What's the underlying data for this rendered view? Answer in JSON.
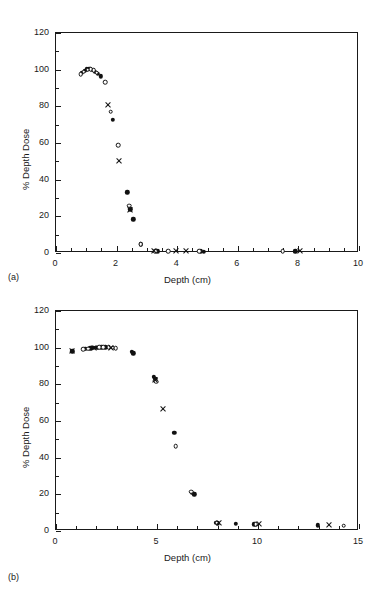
{
  "figure": {
    "panels": [
      {
        "id": "a",
        "sublabel": "(a)",
        "chart_data": {
          "type": "scatter",
          "title": "",
          "xlabel": "Depth (cm)",
          "ylabel": "% Depth Dose",
          "xlim": [
            0,
            10
          ],
          "ylim": [
            0,
            120
          ],
          "xticks": [
            0,
            2,
            4,
            6,
            8,
            10
          ],
          "yticks": [
            0,
            20,
            40,
            60,
            80,
            100,
            120
          ],
          "xminor_step": 0.5,
          "yminor_step": 10,
          "grid": false,
          "legend": "none",
          "series": [
            {
              "name": "filled-circle",
              "marker": "filled-circle",
              "points": [
                [
                  0.85,
                  98.3
                ],
                [
                  0.95,
                  99.4
                ],
                [
                  1.02,
                  100.2
                ],
                [
                  1.1,
                  100.4
                ],
                [
                  1.18,
                  100.0
                ],
                [
                  1.28,
                  99.0
                ],
                [
                  1.38,
                  97.8
                ],
                [
                  1.48,
                  96.3
                ],
                [
                  1.88,
                  72.8
                ],
                [
                  2.35,
                  33.2
                ],
                [
                  2.45,
                  23.8
                ],
                [
                  2.55,
                  18.4
                ],
                [
                  2.8,
                  4.7
                ],
                [
                  3.35,
                  1.0
                ],
                [
                  4.78,
                  0.9
                ],
                [
                  4.88,
                  0.8
                ],
                [
                  7.9,
                  0.9
                ]
              ]
            },
            {
              "name": "open-circle",
              "marker": "open-circle",
              "points": [
                [
                  0.82,
                  97.6
                ],
                [
                  0.92,
                  99.0
                ],
                [
                  1.05,
                  100.0
                ],
                [
                  1.15,
                  100.3
                ],
                [
                  1.25,
                  99.6
                ],
                [
                  1.35,
                  98.4
                ],
                [
                  1.62,
                  93.2
                ],
                [
                  1.8,
                  77.0
                ],
                [
                  2.05,
                  58.8
                ],
                [
                  2.42,
                  25.8
                ],
                [
                  2.8,
                  4.8
                ],
                [
                  3.28,
                  0.9
                ],
                [
                  3.7,
                  0.9
                ],
                [
                  4.72,
                  0.9
                ],
                [
                  7.48,
                  0.9
                ]
              ]
            },
            {
              "name": "cross",
              "marker": "cross",
              "points": [
                [
                  1.72,
                  81.0
                ],
                [
                  2.08,
                  50.0
                ],
                [
                  2.43,
                  23.5
                ],
                [
                  3.22,
                  0.9
                ],
                [
                  3.95,
                  0.9
                ],
                [
                  4.3,
                  0.9
                ],
                [
                  8.05,
                  0.9
                ]
              ]
            }
          ]
        }
      },
      {
        "id": "b",
        "sublabel": "(b)",
        "chart_data": {
          "type": "scatter",
          "title": "",
          "xlabel": "Depth  (cm)",
          "ylabel": "% Depth Dose",
          "xlim": [
            0,
            15
          ],
          "ylim": [
            0,
            120
          ],
          "xticks": [
            0,
            5,
            10,
            15
          ],
          "yticks": [
            0,
            20,
            40,
            60,
            80,
            100,
            120
          ],
          "xminor_step": 1,
          "yminor_step": 10,
          "grid": false,
          "legend": "none",
          "series": [
            {
              "name": "filled-circle",
              "marker": "filled-circle",
              "points": [
                [
                  0.8,
                  98.0
                ],
                [
                  1.45,
                  99.3
                ],
                [
                  1.7,
                  99.6
                ],
                [
                  1.85,
                  99.8
                ],
                [
                  2.05,
                  100.0
                ],
                [
                  2.25,
                  100.2
                ],
                [
                  2.45,
                  100.1
                ],
                [
                  3.75,
                  97.6
                ],
                [
                  3.82,
                  97.0
                ],
                [
                  4.85,
                  84.2
                ],
                [
                  4.92,
                  83.0
                ],
                [
                  5.85,
                  53.6
                ],
                [
                  6.72,
                  20.8
                ],
                [
                  6.85,
                  20.0
                ],
                [
                  7.92,
                  4.5
                ],
                [
                  8.02,
                  4.2
                ],
                [
                  8.9,
                  3.9
                ],
                [
                  9.82,
                  3.7
                ],
                [
                  12.95,
                  3.2
                ]
              ]
            },
            {
              "name": "open-circle",
              "marker": "open-circle",
              "points": [
                [
                  1.35,
                  99.2
                ],
                [
                  1.6,
                  99.5
                ],
                [
                  2.15,
                  100.1
                ],
                [
                  2.35,
                  100.2
                ],
                [
                  2.6,
                  100.1
                ],
                [
                  2.8,
                  99.9
                ],
                [
                  2.95,
                  99.7
                ],
                [
                  4.88,
                  82.0
                ],
                [
                  4.95,
                  81.4
                ],
                [
                  5.92,
                  46.2
                ],
                [
                  6.68,
                  21.4
                ],
                [
                  7.95,
                  4.6
                ],
                [
                  9.88,
                  3.8
                ],
                [
                  14.25,
                  2.9
                ]
              ]
            },
            {
              "name": "cross",
              "marker": "cross",
              "points": [
                [
                  0.78,
                  98.0
                ],
                [
                  1.9,
                  99.9
                ],
                [
                  2.7,
                  100.0
                ],
                [
                  4.9,
                  82.6
                ],
                [
                  5.3,
                  66.8
                ],
                [
                  8.08,
                  4.4
                ],
                [
                  10.05,
                  3.8
                ],
                [
                  13.5,
                  3.2
                ]
              ]
            }
          ]
        }
      }
    ]
  }
}
